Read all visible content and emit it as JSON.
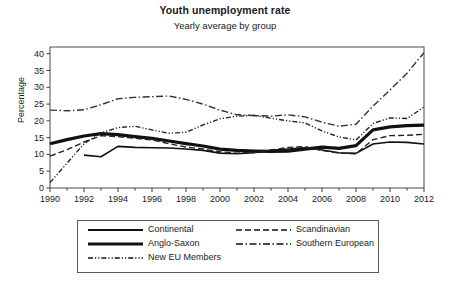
{
  "chart_data": {
    "type": "line",
    "title": "Youth unemployment rate",
    "subtitle": "Yearly average by group",
    "xlabel": "",
    "ylabel": "Percentage",
    "xlim": [
      1990,
      2012
    ],
    "ylim": [
      0,
      42
    ],
    "grid": false,
    "legend_position": "bottom",
    "x": [
      1990,
      1991,
      1992,
      1993,
      1994,
      1995,
      1996,
      1997,
      1998,
      1999,
      2000,
      2001,
      2002,
      2003,
      2004,
      2005,
      2006,
      2007,
      2008,
      2009,
      2010,
      2011,
      2012
    ],
    "y_ticks": [
      0,
      5,
      10,
      15,
      20,
      25,
      30,
      35,
      40
    ],
    "x_ticks": [
      1990,
      1992,
      1994,
      1996,
      1998,
      2000,
      2002,
      2004,
      2006,
      2008,
      2010,
      2012
    ],
    "x_minor_ticks": [
      1991,
      1993,
      1995,
      1997,
      1999,
      2001,
      2003,
      2005,
      2007,
      2009,
      2011
    ],
    "series": [
      {
        "name": "Continental",
        "style": "solid",
        "width": 1.6,
        "color": "#111111",
        "x": [
          1992,
          1993,
          1994,
          1995,
          1996,
          1997,
          1998,
          1999,
          2000,
          2001,
          2002,
          2003,
          2004,
          2005,
          2006,
          2007,
          2008,
          2009,
          2010,
          2011,
          2012
        ],
        "values": [
          9.8,
          9.3,
          12.4,
          12.1,
          12.0,
          11.9,
          11.6,
          11.2,
          10.4,
          10.2,
          10.5,
          11.2,
          11.6,
          12.0,
          11.3,
          10.5,
          10.3,
          13.1,
          13.7,
          13.6,
          13.1
        ]
      },
      {
        "name": "Anglo-Saxon",
        "style": "solid",
        "width": 3.2,
        "color": "#111111",
        "x": [
          1990,
          1991,
          1992,
          1993,
          1994,
          1995,
          1996,
          1997,
          1998,
          1999,
          2000,
          2001,
          2002,
          2003,
          2004,
          2005,
          2006,
          2007,
          2008,
          2009,
          2010,
          2011,
          2012
        ],
        "values": [
          13.2,
          14.4,
          15.5,
          16.2,
          15.9,
          15.3,
          14.8,
          14.0,
          13.2,
          12.5,
          11.6,
          11.2,
          11.0,
          10.9,
          11.0,
          11.6,
          12.2,
          11.8,
          12.6,
          17.3,
          18.2,
          18.6,
          18.7
        ]
      },
      {
        "name": "New EU Members",
        "style": "dash-dot-dot",
        "width": 1.4,
        "color": "#222222",
        "x": [
          1990,
          1991,
          1992,
          1993,
          1994,
          1995,
          1996,
          1997,
          1998,
          1999,
          2000,
          2001,
          2002,
          2003,
          2004,
          2005,
          2006,
          2007,
          2008,
          2009,
          2010,
          2011,
          2012
        ],
        "values": [
          1.6,
          7.4,
          13.2,
          16.4,
          18.0,
          18.4,
          17.3,
          16.3,
          16.6,
          18.8,
          20.6,
          21.4,
          21.6,
          20.8,
          20.0,
          19.4,
          17.0,
          15.2,
          14.3,
          19.2,
          20.9,
          20.7,
          24.1
        ]
      },
      {
        "name": "Scandinavian",
        "style": "dashed",
        "width": 1.4,
        "color": "#222222",
        "x": [
          1990,
          1991,
          1992,
          1993,
          1994,
          1995,
          1996,
          1997,
          1998,
          1999,
          2000,
          2001,
          2002,
          2003,
          2004,
          2005,
          2006,
          2007,
          2008,
          2009,
          2010,
          2011,
          2012
        ],
        "values": [
          9.5,
          11.4,
          13.7,
          15.6,
          15.3,
          14.8,
          14.3,
          13.2,
          12.2,
          11.6,
          10.8,
          10.4,
          10.6,
          11.3,
          12.1,
          12.3,
          11.2,
          10.4,
          10.2,
          14.4,
          15.6,
          15.7,
          16.0
        ]
      },
      {
        "name": "Southern European",
        "style": "dash-dot",
        "width": 1.4,
        "color": "#333333",
        "x": [
          1990,
          1991,
          1992,
          1993,
          1994,
          1995,
          1996,
          1997,
          1998,
          1999,
          2000,
          2001,
          2002,
          2003,
          2004,
          2005,
          2006,
          2007,
          2008,
          2009,
          2010,
          2011,
          2012
        ],
        "values": [
          23.2,
          23.0,
          23.3,
          24.8,
          26.6,
          27.0,
          27.2,
          27.4,
          26.4,
          25.0,
          23.2,
          21.8,
          21.6,
          21.4,
          21.8,
          21.2,
          19.6,
          18.4,
          19.0,
          24.4,
          29.2,
          34.2,
          40.3
        ]
      }
    ]
  },
  "legend": {
    "items": [
      {
        "label": "Continental",
        "style": "solid"
      },
      {
        "label": "Anglo-Saxon",
        "style": "solid-thick"
      },
      {
        "label": "New EU Members",
        "style": "dash-dot-dot"
      },
      {
        "label": "Scandinavian",
        "style": "dashed"
      },
      {
        "label": "Southern European",
        "style": "dash-dot"
      }
    ]
  }
}
